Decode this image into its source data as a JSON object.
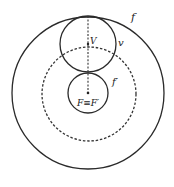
{
  "diagram": {
    "labels": {
      "outer_circle": "f",
      "upper_circle": "v",
      "dashed_circle": "f′",
      "vertex_point": "V",
      "focus_point": "F≡F′"
    },
    "colors": {
      "stroke": "#2a2a2a",
      "background": "#ffffff"
    },
    "circles": [
      {
        "name": "outer-circle-f",
        "cx": 88,
        "cy": 93,
        "r": 76,
        "style": "solid"
      },
      {
        "name": "dashed-circle-f-prime",
        "cx": 89,
        "cy": 94,
        "r": 47,
        "style": "dashed"
      },
      {
        "name": "upper-circle-v",
        "cx": 88,
        "cy": 44,
        "r": 28,
        "style": "solid"
      },
      {
        "name": "lower-circle-focus",
        "cx": 88,
        "cy": 93,
        "r": 20,
        "style": "solid"
      }
    ]
  }
}
